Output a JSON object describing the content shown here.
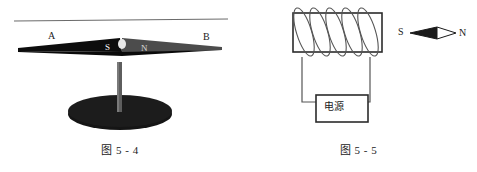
{
  "page": {
    "background": "#ffffff",
    "width": 477,
    "height": 172
  },
  "figures": [
    {
      "id": "fig-5-4",
      "caption": "图 5 - 4",
      "description": "磁针放在支架上",
      "labels": {
        "left_end": "A",
        "right_end": "B",
        "south_pole": "S",
        "north_pole": "N"
      },
      "colors": {
        "needle_dark": "#111111",
        "needle_grey": "#4a4a4a",
        "base": "#151515",
        "stand": "#5a5a5a",
        "rule_line": "#6b6b6b"
      }
    },
    {
      "id": "fig-5-5",
      "caption": "图 5 - 5",
      "description": "通电螺线管与小磁针",
      "labels": {
        "power_source": "电源",
        "south_pole": "S",
        "north_pole": "N"
      },
      "coil": {
        "turns": 5
      },
      "colors": {
        "outline": "#2b2b2b",
        "wire": "#555555",
        "needle_fill": "#1a1a1a",
        "needle_outline": "#1a1a1a"
      }
    }
  ],
  "captions": {
    "left": "图 5 - 4",
    "right": "图 5 - 5"
  },
  "icon_names": {
    "compass_needle": "compass-needle-icon",
    "solenoid": "solenoid-coil-icon",
    "power_box": "power-source-box-icon",
    "stand": "needle-stand-icon"
  }
}
